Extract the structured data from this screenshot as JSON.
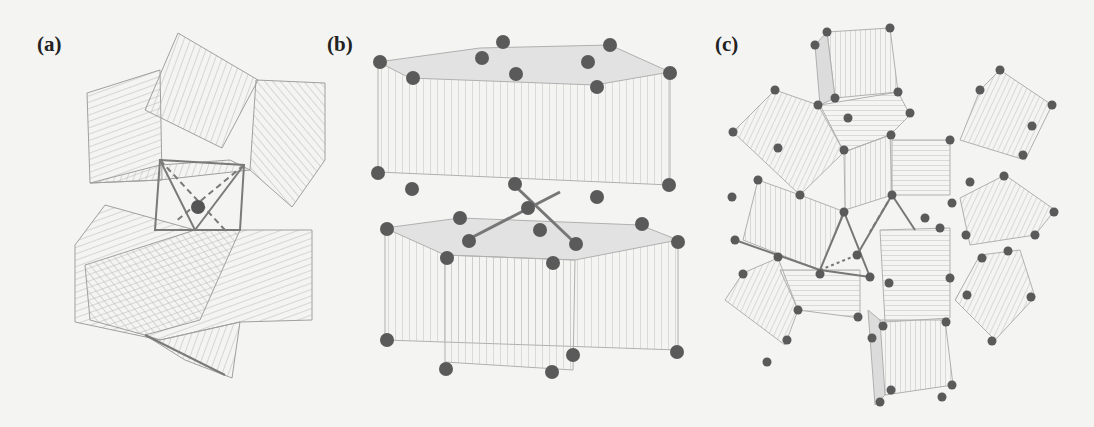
{
  "figure": {
    "panels": [
      {
        "id": "a",
        "label": "(a)",
        "description": "Polyhedral framework with central cation in a cubic/octahedral cage"
      },
      {
        "id": "b",
        "label": "(b)",
        "description": "Layered hexagonal prism stacking with central atom bonded to four neighbors"
      },
      {
        "id": "c",
        "label": "(c)",
        "description": "Cluster of cubic units arranged around central site with bonds"
      }
    ]
  },
  "colors": {
    "background": "#f4f4f2",
    "line": "#9a9a9a",
    "hatch": "#b8b8b8",
    "atom": "#555555",
    "bond": "#777777"
  }
}
